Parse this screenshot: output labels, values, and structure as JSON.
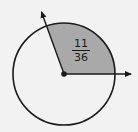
{
  "diagram": {
    "type": "circle-sector",
    "center": [
      64,
      74
    ],
    "radius": 51,
    "sector": {
      "start_angle_deg": 0,
      "end_angle_deg": 110,
      "fill": "#a9a9a9",
      "label": {
        "numerator": "11",
        "denominator": "36"
      }
    },
    "rays": [
      {
        "name": "horizontal-ray",
        "direction_deg": 0
      },
      {
        "name": "angled-ray",
        "direction_deg": 110
      }
    ],
    "stroke_color": "#1a1a1a",
    "background": "#f2f2f2"
  }
}
